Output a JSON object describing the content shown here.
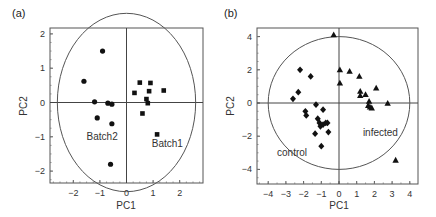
{
  "chart_data": [
    {
      "panel": "(a)",
      "type": "scatter",
      "title": "",
      "xlabel": "PC1",
      "ylabel": "PC2",
      "xlim": [
        -2.9,
        2.9
      ],
      "ylim": [
        -2.2,
        2.2
      ],
      "xticks": [
        -2,
        -1,
        0,
        1,
        2
      ],
      "yticks": [
        -2,
        -1,
        0,
        1,
        2
      ],
      "grid": false,
      "circle_radius": 2.6,
      "series": [
        {
          "name": "Batch2",
          "marker": "circle",
          "points": [
            [
              -0.9,
              1.5
            ],
            [
              -1.6,
              0.62
            ],
            [
              -1.2,
              0.02
            ],
            [
              -0.7,
              -0.02
            ],
            [
              -0.55,
              -0.05
            ],
            [
              -1.1,
              -0.45
            ],
            [
              -0.55,
              -0.62
            ],
            [
              -0.6,
              -1.8
            ]
          ]
        },
        {
          "name": "Batch1",
          "marker": "square",
          "points": [
            [
              0.5,
              0.58
            ],
            [
              0.9,
              0.57
            ],
            [
              0.3,
              0.28
            ],
            [
              0.85,
              0.33
            ],
            [
              1.4,
              0.35
            ],
            [
              0.75,
              0.1
            ],
            [
              0.8,
              -0.02
            ],
            [
              0.6,
              -0.32
            ],
            [
              1.15,
              -0.93
            ]
          ]
        }
      ],
      "annotations": [
        {
          "text": "Batch2",
          "x": -1.5,
          "y": -1.1
        },
        {
          "text": "Batch1",
          "x": 0.95,
          "y": -1.3
        }
      ]
    },
    {
      "panel": "(b)",
      "type": "scatter",
      "title": "",
      "xlabel": "PC1",
      "ylabel": "PC2",
      "xlim": [
        -4.7,
        4.5
      ],
      "ylim": [
        -4.3,
        4.5
      ],
      "xticks": [
        -4,
        -3,
        -2,
        -1,
        0,
        1,
        2,
        3,
        4
      ],
      "yticks": [
        -4,
        -2,
        0,
        2,
        4
      ],
      "grid": false,
      "circle_radius": 4.0,
      "series": [
        {
          "name": "control",
          "marker": "diamond",
          "points": [
            [
              -2.2,
              2.0
            ],
            [
              -1.6,
              1.6
            ],
            [
              -2.3,
              0.65
            ],
            [
              -2.6,
              0.25
            ],
            [
              -1.3,
              -0.1
            ],
            [
              -0.9,
              -0.4
            ],
            [
              -1.9,
              -0.5
            ],
            [
              -1.85,
              -0.75
            ],
            [
              -1.2,
              -0.95
            ],
            [
              -1.1,
              -1.2
            ],
            [
              -1.05,
              -1.4
            ],
            [
              -0.9,
              -1.3
            ],
            [
              -0.75,
              -1.2
            ],
            [
              -0.65,
              -1.2
            ],
            [
              -1.35,
              -1.85
            ],
            [
              -0.6,
              -1.75
            ],
            [
              -1.0,
              -2.6
            ]
          ]
        },
        {
          "name": "infected",
          "marker": "triangle",
          "points": [
            [
              -0.3,
              4.1
            ],
            [
              0.05,
              2.0
            ],
            [
              0.6,
              1.9
            ],
            [
              1.15,
              1.6
            ],
            [
              0.05,
              1.2
            ],
            [
              1.2,
              0.7
            ],
            [
              1.2,
              0.45
            ],
            [
              1.5,
              0.5
            ],
            [
              2.1,
              0.9
            ],
            [
              1.7,
              0.1
            ],
            [
              1.65,
              -0.15
            ],
            [
              1.75,
              -0.25
            ],
            [
              1.85,
              -0.3
            ],
            [
              2.75,
              -0.02
            ],
            [
              3.2,
              -3.45
            ]
          ]
        }
      ],
      "annotations": [
        {
          "text": "infected",
          "x": 1.35,
          "y": -2.0
        },
        {
          "text": "control",
          "x": -3.5,
          "y": -3.2
        }
      ]
    }
  ],
  "panels": {
    "a": {
      "label": "(a)",
      "xlabel": "PC1",
      "ylabel": "PC2",
      "ann1": "Batch2",
      "ann2": "Batch1"
    },
    "b": {
      "label": "(b)",
      "xlabel": "PC1",
      "ylabel": "PC2",
      "ann1": "control",
      "ann2": "infected"
    }
  }
}
